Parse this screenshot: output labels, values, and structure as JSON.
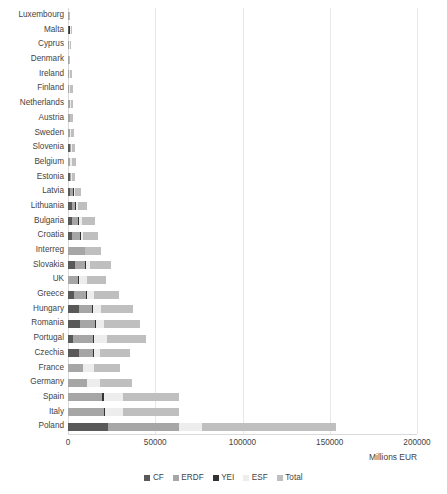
{
  "chart_data": {
    "type": "bar",
    "orientation": "horizontal",
    "stacked": true,
    "title": "",
    "xlabel": "Millions EUR",
    "ylabel": "",
    "xlim": [
      0,
      200000
    ],
    "xticks": [
      0,
      50000,
      100000,
      150000,
      200000
    ],
    "xtick_labels": [
      "0",
      "50000",
      "100000",
      "150000",
      "200000"
    ],
    "grid": true,
    "grid_axis": "x",
    "legend_position": "bottom",
    "legend": [
      "CF",
      "ERDF",
      "YEI",
      "ESF",
      "Total"
    ],
    "series_colors": {
      "CF": "#595959",
      "ERDF": "#a6a6a6",
      "YEI": "#333333",
      "ESF": "#ededed",
      "Total": "#bfbfbf"
    },
    "categories": [
      "Luxembourg",
      "Malta",
      "Cyprus",
      "Denmark",
      "Ireland",
      "Finland",
      "Netherlands",
      "Austria",
      "Sweden",
      "Slovenia",
      "Belgium",
      "Estonia",
      "Latvia",
      "Lithuania",
      "Bulgaria",
      "Croatia",
      "Interreg",
      "Slovakia",
      "UK",
      "Greece",
      "Hungary",
      "Romania",
      "Portugal",
      "Czechia",
      "France",
      "Germany",
      "Spain",
      "Italy",
      "Poland"
    ],
    "series": [
      {
        "name": "CF",
        "values": [
          0,
          220,
          0,
          0,
          0,
          0,
          0,
          0,
          0,
          895,
          0,
          1073,
          1349,
          2048,
          2279,
          2559,
          0,
          4168,
          0,
          3250,
          6025,
          6935,
          2861,
          6259,
          0,
          0,
          0,
          0,
          23208
        ]
      },
      {
        "name": "ERDF",
        "values": [
          40,
          217,
          279,
          206,
          409,
          793,
          1015,
          978,
          927,
          652,
          939,
          590,
          1468,
          2049,
          3575,
          4321,
          9459,
          5764,
          5770,
          7356,
          7709,
          8586,
          11466,
          8002,
          8426,
          10776,
          19408,
          20694,
          40213
        ]
      },
      {
        "name": "YEI",
        "values": [
          0,
          21,
          23,
          0,
          68,
          0,
          0,
          0,
          44,
          9,
          42,
          0,
          29,
          31,
          55,
          66,
          0,
          72,
          206,
          172,
          49,
          212,
          160,
          14,
          310,
          0,
          943,
          567,
          252
        ]
      },
      {
        "name": "ESF",
        "values": [
          20,
          132,
          130,
          207,
          545,
          515,
          507,
          442,
          675,
          369,
          1028,
          340,
          637,
          1112,
          1530,
          1516,
          0,
          2181,
          4920,
          3639,
          4694,
          4772,
          7809,
          3431,
          6027,
          7495,
          11322,
          10467,
          13153
        ]
      },
      {
        "name": "Total",
        "values": [
          60,
          590,
          432,
          413,
          1022,
          1308,
          1522,
          1420,
          1646,
          1925,
          2009,
          2003,
          3483,
          5240,
          7439,
          8462,
          9459,
          12185,
          10896,
          14417,
          18477,
          20505,
          22296,
          17706,
          14763,
          18271,
          31673,
          31728,
          76813
        ]
      }
    ],
    "bar_totals": [
      120,
      1180,
      864,
      826,
      2044,
      2616,
      3044,
      2840,
      3292,
      3850,
      4018,
      4006,
      6966,
      10480,
      14878,
      16924,
      18918,
      24370,
      21792,
      28834,
      36954,
      41010,
      44592,
      35412,
      29526,
      36542,
      63346,
      63456,
      153639
    ]
  }
}
